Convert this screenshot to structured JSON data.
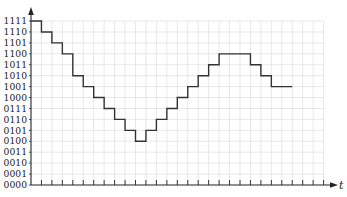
{
  "chart_data": {
    "type": "line",
    "subtype": "step",
    "title": "",
    "xlabel": "t",
    "ylabel": "",
    "y_tick_labels": [
      "0000",
      "0001",
      "0010",
      "0011",
      "0100",
      "0101",
      "0110",
      "0111",
      "1000",
      "1001",
      "1010",
      "1011",
      "1100",
      "1101",
      "1110",
      "1111"
    ],
    "x_ticks": 28,
    "grid": true,
    "legend": null,
    "ylim": [
      0,
      15
    ],
    "series": [
      {
        "name": "quantized signal",
        "sample_index": [
          0,
          1,
          2,
          3,
          4,
          5,
          6,
          7,
          8,
          9,
          10,
          11,
          12,
          13,
          14,
          15,
          16,
          17,
          18,
          19,
          20,
          21,
          22,
          23,
          24
        ],
        "values": [
          15,
          14,
          13,
          12,
          10,
          9,
          8,
          7,
          6,
          5,
          4,
          5,
          6,
          7,
          8,
          9,
          10,
          11,
          12,
          12,
          12,
          11,
          10,
          9,
          9
        ],
        "binary": [
          "1111",
          "1110",
          "1101",
          "1100",
          "1010",
          "1001",
          "1000",
          "0111",
          "0110",
          "0101",
          "0100",
          "0101",
          "0110",
          "0111",
          "1000",
          "1001",
          "1010",
          "1011",
          "1100",
          "1100",
          "1100",
          "1011",
          "1010",
          "1001",
          "1001"
        ]
      }
    ],
    "colors": {
      "line": "#333333",
      "grid": "#d9d9d9",
      "axis": "#222222"
    }
  },
  "axis": {
    "t_label": "t"
  }
}
